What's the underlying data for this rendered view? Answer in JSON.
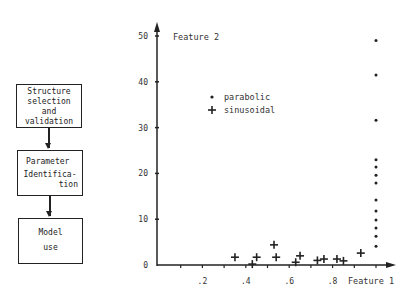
{
  "flowchart": {
    "boxes": [
      {
        "lines": [
          "Structure",
          "selection",
          "and",
          "validation"
        ]
      },
      {
        "lines": [
          "Parameter",
          "Identifica-",
          "tion"
        ]
      },
      {
        "lines": [
          "Model",
          "use"
        ]
      }
    ]
  },
  "chart_data": {
    "type": "scatter",
    "title": "",
    "xlabel": "Feature 1",
    "ylabel": "Feature 2",
    "x_ticks": [
      ".2",
      ".4",
      ".6",
      ".8"
    ],
    "y_ticks": [
      "0",
      "10",
      "20",
      "30",
      "40",
      "50"
    ],
    "xlim": [
      0,
      1.05
    ],
    "ylim": [
      0,
      52
    ],
    "legend": [
      {
        "marker": "dot",
        "label": "parabolic"
      },
      {
        "marker": "plus",
        "label": "sinusoidal"
      }
    ],
    "series": [
      {
        "name": "parabolic",
        "marker": "dot",
        "points": [
          [
            1.0,
            49
          ],
          [
            1.0,
            41.5
          ],
          [
            1.0,
            31.6
          ],
          [
            1.0,
            23
          ],
          [
            1.0,
            21.4
          ],
          [
            1.0,
            19.6
          ],
          [
            1.0,
            17.9
          ],
          [
            1.0,
            14.2
          ],
          [
            1.0,
            11.8
          ],
          [
            1.0,
            9.8
          ],
          [
            1.0,
            8.1
          ],
          [
            1.0,
            6.3
          ],
          [
            1.0,
            4.1
          ]
        ]
      },
      {
        "name": "sinusoidal",
        "marker": "plus",
        "points": [
          [
            0.35,
            1.7
          ],
          [
            0.43,
            0.2
          ],
          [
            0.45,
            1.7
          ],
          [
            0.53,
            4.4
          ],
          [
            0.54,
            1.7
          ],
          [
            0.63,
            0.6
          ],
          [
            0.65,
            2.0
          ],
          [
            0.73,
            1.0
          ],
          [
            0.76,
            1.3
          ],
          [
            0.82,
            1.3
          ],
          [
            0.85,
            0.9
          ],
          [
            0.93,
            2.6
          ]
        ]
      }
    ]
  }
}
